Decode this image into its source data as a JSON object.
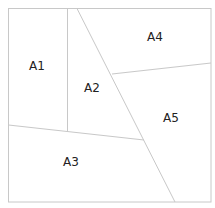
{
  "diagram": {
    "type": "region-partition",
    "outer_box": {
      "x1": 8,
      "y1": 8,
      "x2": 211,
      "y2": 202
    },
    "lines": [
      {
        "id": "vertical-divider",
        "x1": 67,
        "y1": 8,
        "x2": 67,
        "y2": 131
      },
      {
        "id": "main-diagonal",
        "x1": 77,
        "y1": 8,
        "x2": 175,
        "y2": 202
      },
      {
        "id": "a4-a5-divider",
        "x1": 112,
        "y1": 74,
        "x2": 211,
        "y2": 63
      },
      {
        "id": "a3-upper-divider",
        "x1": 8,
        "y1": 125,
        "x2": 144,
        "y2": 140
      }
    ],
    "regions": [
      {
        "id": "A1",
        "label": "A1",
        "x": 37,
        "y": 70
      },
      {
        "id": "A2",
        "label": "A2",
        "x": 92,
        "y": 92
      },
      {
        "id": "A3",
        "label": "A3",
        "x": 71,
        "y": 166
      },
      {
        "id": "A4",
        "label": "A4",
        "x": 155,
        "y": 41
      },
      {
        "id": "A5",
        "label": "A5",
        "x": 171,
        "y": 122
      }
    ]
  }
}
